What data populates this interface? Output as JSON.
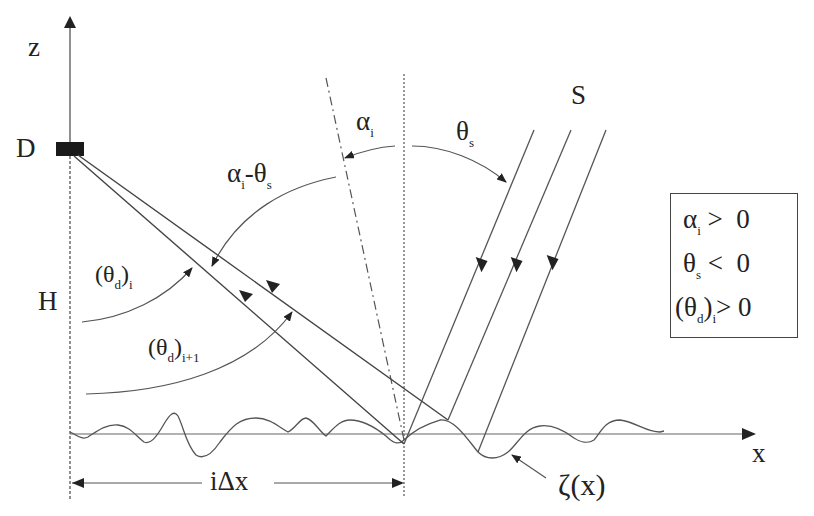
{
  "labels": {
    "z_axis": "z",
    "x_axis": "x",
    "detector": "D",
    "height": "H",
    "source": "S",
    "alpha_i": {
      "main": "α",
      "sub": "i"
    },
    "theta_s": {
      "main": "θ",
      "sub": "s"
    },
    "alpha_minus_theta": {
      "a": "α",
      "a_sub": "i",
      "dash": "-",
      "t": "θ",
      "t_sub": "s"
    },
    "theta_d_i": {
      "open": "(θ",
      "sub1": "d",
      "close": ")",
      "sub2": "i"
    },
    "theta_d_i1": {
      "open": "(θ",
      "sub1": "d",
      "close": ")",
      "sub2": "i+1"
    },
    "i_delta_x": "iΔx",
    "surface": "ζ(x)"
  },
  "legend": {
    "rows": [
      {
        "sym": "α",
        "sub": "i",
        "rel": " >  0"
      },
      {
        "sym": "θ",
        "sub": "s",
        "rel": " <  0"
      },
      {
        "sym": "(θ",
        "sub": "d",
        "close": ")",
        "sub2": "i",
        "rel": "> 0"
      }
    ]
  },
  "colors": {
    "line": "#555555",
    "dark": "#222222",
    "detector": "#1a1a1a"
  }
}
